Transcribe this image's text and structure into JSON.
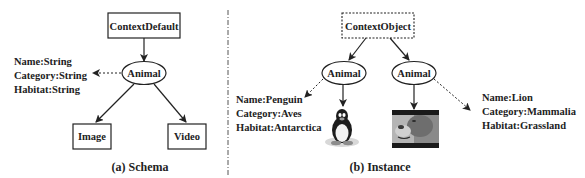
{
  "schema": {
    "root": "ContextDefault",
    "entity": "Animal",
    "attributes": [
      "Name:String",
      "Category:String",
      "Habitat:String"
    ],
    "children": [
      "Image",
      "Video"
    ],
    "caption": "(a)  Schema"
  },
  "instance": {
    "root": "ContextObject",
    "left": {
      "entity": "Animal",
      "media": "penguin-image",
      "attributes": [
        "Name:Penguin",
        "Category:Aves",
        "Habitat:Antarctica"
      ]
    },
    "right": {
      "entity": "Animal",
      "media": "lion-video-frame",
      "attributes": [
        "Name:Lion",
        "Category:Mammalia",
        "Habitat:Grassland"
      ]
    },
    "caption": "(b)  Instance"
  },
  "colors": {
    "stroke": "#222222",
    "background": "#ffffff"
  }
}
